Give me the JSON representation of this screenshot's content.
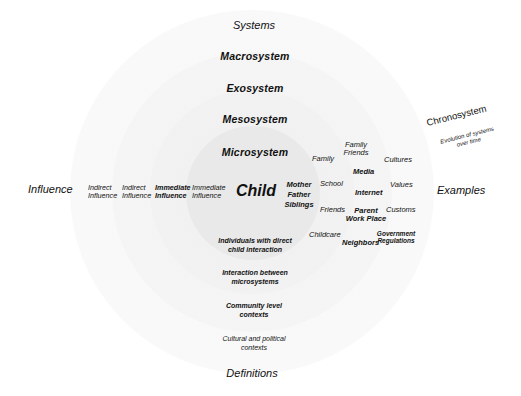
{
  "diagram": {
    "colors": {
      "microsystem_fill": "#e9e9e9",
      "outer_ring_fill": "#f6f6f6",
      "text": "#111111"
    },
    "axis_labels": {
      "top": "Systems",
      "left": "Influence",
      "right": "Examples",
      "bottom": "Definitions"
    },
    "center": "Child",
    "systems": [
      {
        "name": "Macrosystem"
      },
      {
        "name": "Exosystem"
      },
      {
        "name": "Mesosystem"
      },
      {
        "name": "Microsystem"
      }
    ],
    "influence": [
      {
        "line1": "Indirect",
        "line2": "Influence"
      },
      {
        "line1": "Indirect",
        "line2": "Influence"
      },
      {
        "line1": "Immediate",
        "line2": "Influence"
      },
      {
        "line1": "Immediate",
        "line2": "Influence"
      }
    ],
    "examples": {
      "microsystem": {
        "line1": "Mother",
        "line2": "Father",
        "line3": "Siblings"
      },
      "mesosystem": [
        "Family",
        "School",
        "Friends",
        "Childcare"
      ],
      "exosystem": {
        "family_friends_1": "Family",
        "family_friends_2": "Friends",
        "media": "Media",
        "internet": "Internet",
        "parent_work_1": "Parent",
        "parent_work_2": "Work Place",
        "neighbors": "Neighbors"
      },
      "macrosystem": {
        "cultures": "Cultures",
        "values": "Values",
        "customs": "Customs",
        "gov_1": "Government",
        "gov_2": "Regulations"
      }
    },
    "definitions": [
      {
        "line1": "Individuals with direct",
        "line2": "child interaction"
      },
      {
        "line1": "Interaction between",
        "line2": "microsystems"
      },
      {
        "line1": "Community level",
        "line2": "contexts"
      },
      {
        "line1": "Cultural and political",
        "line2": "contexts"
      }
    ],
    "chronosystem": {
      "title": "Chronosystem",
      "desc_line1": "Evolution of systems",
      "desc_line2": "over time"
    }
  }
}
